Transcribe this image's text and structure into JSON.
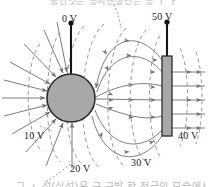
{
  "figure": {
    "title_fragment_top": "중간것은 등퍼텐셜면은 등 ㅣ ㅏ ㅣ ㅏ",
    "caption_fragment_bottom": "그 ㅅ 선(실선)은 구 근방 한 전극의 모습에서",
    "labels": [
      {
        "id": "sphere-potential",
        "text": "0 V",
        "x": 62,
        "y": 13
      },
      {
        "id": "plate-potential",
        "text": "50 V",
        "x": 152,
        "y": 11
      },
      {
        "id": "equipotential-10v",
        "text": "10 V",
        "x": 24,
        "y": 130
      },
      {
        "id": "equipotential-20v",
        "text": "20 V",
        "x": 70,
        "y": 163
      },
      {
        "id": "equipotential-30v",
        "text": "30 V",
        "x": 131,
        "y": 157
      },
      {
        "id": "equipotential-40v",
        "text": "40 V",
        "x": 178,
        "y": 130
      }
    ],
    "colors": {
      "conductor_fill": "#a8a8a8",
      "conductor_stroke": "#2b2b2b",
      "field_line": "#7d7d7d",
      "equipotential_line": "#9b9b9b",
      "lead_wire": "#151515",
      "label_text": "#1a1a1a",
      "background": "#ffffff"
    },
    "elements": {
      "sphere": {
        "cx": 71,
        "cy": 98,
        "r": 24
      },
      "plate": {
        "x": 162,
        "y": 56,
        "width": 10,
        "height": 80
      },
      "sphere_lead": {
        "x": 71,
        "y_top": 22,
        "y_bottom": 76
      },
      "plate_lead": {
        "x": 167,
        "y_top": 20,
        "y_bottom": 56
      }
    },
    "legend_semantics": {
      "solid_lines": "electric field lines",
      "dashed_lines": "equipotential surfaces"
    }
  }
}
